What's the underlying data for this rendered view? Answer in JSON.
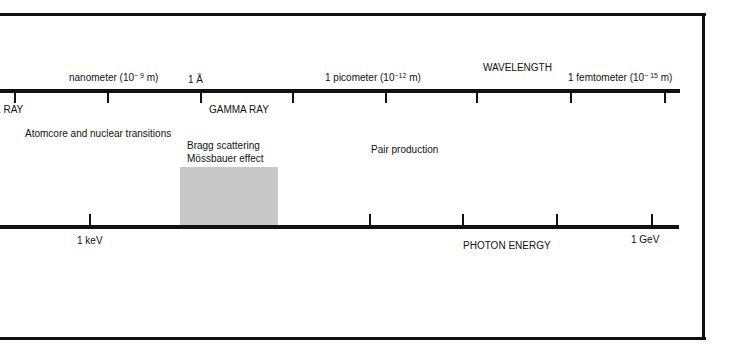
{
  "colors": {
    "line": "#111111",
    "band": "#c8c8c8",
    "background": "#ffffff"
  },
  "wavelength_axis": {
    "title": "WAVELENGTH",
    "ticks_x": [
      15,
      108,
      201,
      293,
      386,
      477,
      571,
      665
    ],
    "labels": {
      "nanometer": {
        "prefix": "nanometer (10",
        "exp": "− 9",
        "suffix": " m)"
      },
      "angstrom": "1 Å",
      "picometer": {
        "prefix": "1 picometer (10",
        "exp": "−12",
        "suffix": " m)"
      },
      "femtometer": {
        "prefix": "1 femtometer (10",
        "exp": "− 15",
        "suffix": " m)"
      }
    }
  },
  "regions": {
    "x_ray": "X RAY",
    "gamma_ray": "GAMMA RAY"
  },
  "phenomena": {
    "atomcore": "Atomcore and nuclear transitions",
    "bragg": "Bragg scattering",
    "mossbauer": "Mössbauer effect",
    "pair": "Pair production"
  },
  "energy_axis": {
    "title": "PHOTON ENERGY",
    "ticks_x": [
      90,
      370,
      463,
      557,
      652
    ],
    "labels": {
      "kev": "1 keV",
      "gev": "1 GeV"
    }
  }
}
